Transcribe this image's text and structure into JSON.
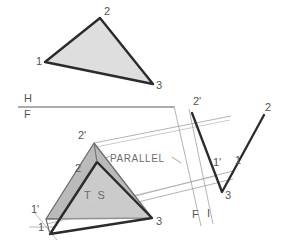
{
  "drawing": {
    "title": "Descriptive geometry: true size of a plane by edge view",
    "colors": {
      "ink": "#2b2b2b",
      "thin_line": "#9a9a9a",
      "fill_light": "#dcdcdc",
      "fill_mid": "#b4b4b4",
      "fill_inner": "#ffffff",
      "label": "#555555",
      "background": "#ffffff"
    },
    "reference_line": {
      "upper_label": "H",
      "lower_label": "F",
      "x1": 18,
      "y1": 107,
      "x2": 173,
      "y2": 107
    },
    "fold_line_labels": {
      "left_label": "F",
      "right_label": "I"
    },
    "annotations": {
      "parallel": "PARALLEL",
      "true_size": "T S"
    },
    "views": [
      {
        "name": "top-view-triangle",
        "fill": "#dcdcdc",
        "points": "45,62 100,18 153,84",
        "vertices": [
          {
            "label": "1",
            "lx": 36,
            "ly": 57
          },
          {
            "label": "2",
            "lx": 104,
            "ly": 8
          },
          {
            "label": "3",
            "lx": 156,
            "ly": 81
          }
        ]
      },
      {
        "name": "auxiliary-true-size-triangle",
        "fill": "#b4b4b4",
        "points": "94,143 152,218 46,219",
        "vertices": [
          {
            "label": "2'",
            "lx": 80,
            "ly": 133
          },
          {
            "label": "1'",
            "lx": 33,
            "ly": 207
          },
          {
            "label": "3",
            "lx": 156,
            "ly": 219
          }
        ]
      },
      {
        "name": "front-view-triangle",
        "fill": "#ffffff",
        "points": "97,162 152,218 50,234",
        "vertices": [
          {
            "label": "2",
            "lx": 77,
            "ly": 166
          },
          {
            "label": "1",
            "lx": 39,
            "ly": 224
          },
          {
            "label": "3",
            "lx": 156,
            "ly": 219
          }
        ]
      },
      {
        "name": "edge-view-left",
        "polyline": "192,113 222,192",
        "vertices": [
          {
            "label": "2'",
            "lx": 194,
            "ly": 99
          },
          {
            "label": "1'",
            "lx": 214,
            "ly": 160
          },
          {
            "label": "3",
            "lx": 225,
            "ly": 192
          }
        ]
      },
      {
        "name": "edge-view-right",
        "polyline": "222,192 264,115",
        "vertices": [
          {
            "label": "2",
            "lx": 266,
            "ly": 104
          },
          {
            "label": "1",
            "lx": 236,
            "ly": 158
          }
        ]
      }
    ],
    "projection_lines": [
      {
        "name": "proj-2prime-upper",
        "x1": 94,
        "y1": 143,
        "x2": 230,
        "y2": 116
      },
      {
        "name": "proj-1prime-mid",
        "x1": 46,
        "y1": 219,
        "x2": 232,
        "y2": 172
      },
      {
        "name": "proj-3-lower",
        "x1": 46,
        "y1": 222,
        "x2": 232,
        "y2": 178
      },
      {
        "name": "proj-ts-band",
        "x1": 55,
        "y1": 214,
        "x2": 214,
        "y2": 175
      },
      {
        "name": "fold-vert-a",
        "x1": 173,
        "y1": 107,
        "x2": 201,
        "y2": 224
      },
      {
        "name": "fold-vert-b",
        "x1": 188,
        "y1": 110,
        "x2": 212,
        "y2": 222
      },
      {
        "name": "tick-left-a",
        "x1": 36,
        "y1": 214,
        "x2": 56,
        "y2": 238
      },
      {
        "name": "tick-left-b",
        "x1": 30,
        "y1": 226,
        "x2": 52,
        "y2": 226
      }
    ]
  }
}
